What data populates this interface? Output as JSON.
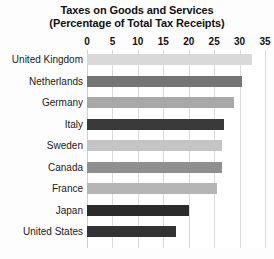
{
  "chart_data": {
    "type": "bar",
    "orientation": "horizontal",
    "title": "Taxes on Goods and Services",
    "subtitle": "(Percentage of Total Tax Receipts)",
    "xlabel": "",
    "ylabel": "",
    "xlim": [
      0,
      35
    ],
    "xticks": [
      0,
      5,
      10,
      15,
      20,
      25,
      30,
      35
    ],
    "xtick_labels": [
      "0",
      "5",
      "10",
      "15",
      "20",
      "25",
      "30",
      "35"
    ],
    "grid": true,
    "legend": "none",
    "categories": [
      "United Kingdom",
      "Netherlands",
      "Germany",
      "Italy",
      "Sweden",
      "Canada",
      "France",
      "Japan",
      "United States"
    ],
    "values": [
      32.5,
      30.5,
      29,
      27,
      26.5,
      26.5,
      25.5,
      20,
      17.5
    ],
    "bar_colors": [
      "#d9d9d9",
      "#757575",
      "#a8a8a8",
      "#3a3a3a",
      "#c4c4c4",
      "#8f8f8f",
      "#b5b5b5",
      "#2b2b2b",
      "#333333"
    ],
    "background_color": "#ffffff",
    "gridline_color": "#dadada"
  }
}
